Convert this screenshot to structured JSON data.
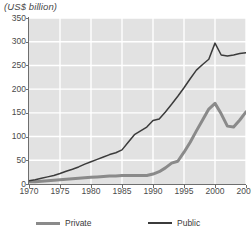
{
  "chart_data": {
    "type": "line",
    "title": "(US$ billion)",
    "xlabel": "",
    "ylabel": "",
    "xlim": [
      1970,
      2005
    ],
    "ylim": [
      0,
      350
    ],
    "grid": true,
    "legend_position": "bottom",
    "x_ticks": [
      "1970",
      "1975",
      "1980",
      "1985",
      "1990",
      "1995",
      "2000",
      "2005"
    ],
    "y_ticks": [
      "0",
      "50",
      "100",
      "150",
      "200",
      "250",
      "300",
      "350"
    ],
    "x": [
      1970,
      1971,
      1972,
      1973,
      1974,
      1975,
      1976,
      1977,
      1978,
      1979,
      1980,
      1981,
      1982,
      1983,
      1984,
      1985,
      1986,
      1987,
      1988,
      1989,
      1990,
      1991,
      1992,
      1993,
      1994,
      1995,
      1996,
      1997,
      1998,
      1999,
      2000,
      2001,
      2002,
      2003,
      2004,
      2005
    ],
    "series": [
      {
        "name": "Public",
        "color": "#3b3b3b",
        "values": [
          7,
          9,
          12,
          15,
          18,
          22,
          27,
          31,
          36,
          42,
          47,
          52,
          57,
          62,
          66,
          72,
          88,
          104,
          112,
          120,
          134,
          137,
          152,
          168,
          185,
          203,
          222,
          240,
          252,
          263,
          297,
          272,
          270,
          272,
          275,
          277
        ]
      },
      {
        "name": "Private",
        "color": "#8a8a8a",
        "values": [
          5,
          5,
          6,
          7,
          8,
          9,
          10,
          11,
          12,
          13,
          14,
          15,
          16,
          17,
          17,
          18,
          18,
          18,
          18,
          18,
          21,
          26,
          34,
          44,
          48,
          67,
          88,
          112,
          135,
          158,
          170,
          148,
          122,
          120,
          135,
          152
        ]
      }
    ]
  },
  "legend": {
    "private_label": "Private",
    "public_label": "Public"
  }
}
